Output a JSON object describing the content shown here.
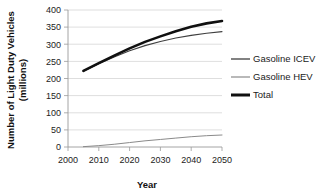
{
  "chart_data": {
    "type": "line",
    "title": "",
    "xlabel": "Year",
    "ylabel": "Number of Light Duty Vehicles (millions)",
    "ylabel_line1": "Number of Light Duty Vehicles",
    "ylabel_line2": "(millions)",
    "xlim": [
      2000,
      2050
    ],
    "ylim": [
      0,
      400
    ],
    "xticks": [
      2000,
      2010,
      2020,
      2030,
      2040,
      2050
    ],
    "yticks": [
      0,
      50,
      100,
      150,
      200,
      250,
      300,
      350,
      400
    ],
    "grid": "horizontal",
    "legend_position": "right",
    "x": [
      2005,
      2010,
      2015,
      2020,
      2025,
      2030,
      2035,
      2040,
      2045,
      2050
    ],
    "series": [
      {
        "name": "Gasoline ICEV",
        "color": "#3f3f3f",
        "width": 1.1,
        "values": [
          221,
          243,
          263,
          281,
          296,
          308,
          318,
          326,
          332,
          337
        ]
      },
      {
        "name": "Gasoline HEV",
        "color": "#8a8a8a",
        "width": 1.0,
        "values": [
          1,
          4,
          8,
          13,
          18,
          22,
          26,
          30,
          33,
          35
        ]
      },
      {
        "name": "Total",
        "color": "#101010",
        "width": 2.6,
        "values": [
          222,
          245,
          267,
          288,
          307,
          323,
          338,
          351,
          361,
          368
        ]
      }
    ]
  },
  "legend": {
    "items": [
      {
        "label": "Gasoline ICEV"
      },
      {
        "label": "Gasoline HEV"
      },
      {
        "label": "Total"
      }
    ]
  },
  "axes": {
    "y_tick_labels": [
      "400",
      "350",
      "300",
      "250",
      "200",
      "150",
      "100",
      "50",
      "0"
    ],
    "x_tick_labels": [
      "2000",
      "2010",
      "2020",
      "2030",
      "2040",
      "2050"
    ]
  }
}
